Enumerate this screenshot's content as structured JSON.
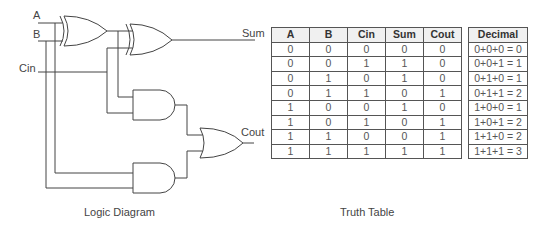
{
  "diagram": {
    "inputs": [
      "A",
      "B",
      "Cin"
    ],
    "outputs": [
      "Sum",
      "Cout"
    ],
    "gates": [
      {
        "id": "xor1",
        "type": "XOR",
        "inputs": [
          "A",
          "B"
        ]
      },
      {
        "id": "xor2",
        "type": "XOR",
        "inputs": [
          "xor1",
          "Cin"
        ],
        "output": "Sum"
      },
      {
        "id": "and1",
        "type": "AND",
        "inputs": [
          "xor1",
          "Cin"
        ]
      },
      {
        "id": "and2",
        "type": "AND",
        "inputs": [
          "A",
          "B"
        ]
      },
      {
        "id": "or1",
        "type": "OR",
        "inputs": [
          "and1",
          "and2"
        ],
        "output": "Cout"
      }
    ],
    "labels": {
      "a": "A",
      "b": "B",
      "cin": "Cin",
      "sum": "Sum",
      "cout": "Cout"
    },
    "caption": "Logic Diagram"
  },
  "truth_table": {
    "headers": [
      "A",
      "B",
      "Cin",
      "Sum",
      "Cout"
    ],
    "rows": [
      [
        "0",
        "0",
        "0",
        "0",
        "0"
      ],
      [
        "0",
        "0",
        "1",
        "1",
        "0"
      ],
      [
        "0",
        "1",
        "0",
        "1",
        "0"
      ],
      [
        "0",
        "1",
        "1",
        "0",
        "1"
      ],
      [
        "1",
        "0",
        "0",
        "1",
        "0"
      ],
      [
        "1",
        "0",
        "1",
        "0",
        "1"
      ],
      [
        "1",
        "1",
        "0",
        "0",
        "1"
      ],
      [
        "1",
        "1",
        "1",
        "1",
        "1"
      ]
    ],
    "caption": "Truth Table"
  },
  "decimal_table": {
    "header": "Decimal",
    "rows": [
      "0+0+0 = 0",
      "0+0+1 = 1",
      "0+1+0 = 1",
      "0+1+1 = 2",
      "1+0+0 = 1",
      "1+0+1 = 2",
      "1+1+0 = 2",
      "1+1+1 = 3"
    ]
  }
}
